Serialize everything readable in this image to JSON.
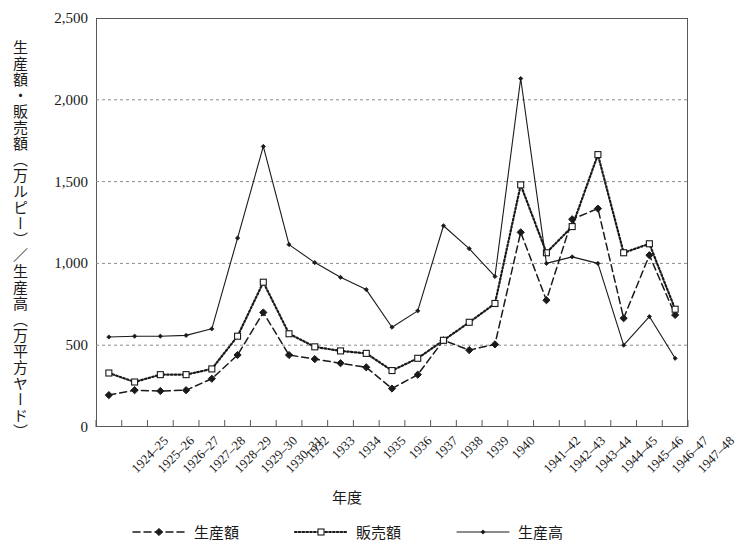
{
  "chart_data": {
    "type": "line",
    "title": "",
    "xlabel": "年度",
    "ylabel": "生産額・販売額（万ルピー）／生産高（万平方ヤード）",
    "ylim": [
      0,
      2500
    ],
    "ytick_values": [
      0,
      500,
      1000,
      1500,
      2000,
      2500
    ],
    "ytick_labels": [
      "0",
      "500",
      "1,000",
      "1,500",
      "2,000",
      "2,500"
    ],
    "grid": "horizontal-dashed",
    "legend_position": "bottom",
    "categories": [
      "1924–25",
      "1925–26",
      "1926–27",
      "1927–28",
      "1928–29",
      "1929–30",
      "1930–31",
      "1932",
      "1933",
      "1934",
      "1935",
      "1936",
      "1937",
      "1938",
      "1939",
      "1940",
      "1941–42",
      "1942–43",
      "1943–44",
      "1944–45",
      "1945–46",
      "1946–47",
      "1947–48"
    ],
    "series": [
      {
        "name": "生産額",
        "marker": "filled-diamond",
        "line_style": "dashed",
        "color": "#1a1a1a",
        "values": [
          195,
          225,
          220,
          225,
          295,
          440,
          700,
          440,
          415,
          390,
          365,
          235,
          320,
          530,
          470,
          505,
          1190,
          775,
          1270,
          1335,
          665,
          1050,
          685
        ]
      },
      {
        "name": "販売額",
        "marker": "open-square",
        "line_style": "dotted",
        "color": "#1a1a1a",
        "values": [
          330,
          275,
          320,
          320,
          355,
          555,
          885,
          570,
          490,
          465,
          450,
          345,
          420,
          530,
          640,
          755,
          1480,
          1065,
          1225,
          1665,
          1065,
          1120,
          720
        ]
      },
      {
        "name": "生産高",
        "marker": "small-filled",
        "line_style": "solid",
        "color": "#1a1a1a",
        "values": [
          550,
          555,
          555,
          560,
          600,
          1155,
          1715,
          1115,
          1005,
          915,
          840,
          610,
          710,
          1230,
          1090,
          920,
          2130,
          1000,
          1040,
          1000,
          500,
          675,
          420
        ]
      }
    ]
  },
  "axis": {
    "ytick_labels": [
      "2,500",
      "2,000",
      "1,500",
      "1,000",
      "500",
      "0"
    ],
    "ytick_values": [
      2500,
      2000,
      1500,
      1000,
      500,
      0
    ]
  },
  "legend": {
    "items": [
      {
        "label": "生産額"
      },
      {
        "label": "販売額"
      },
      {
        "label": "生産高"
      }
    ]
  }
}
